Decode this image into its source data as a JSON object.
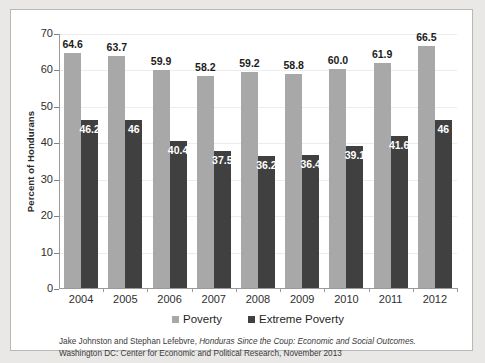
{
  "chart_data": {
    "type": "bar",
    "title": "",
    "xlabel": "",
    "ylabel": "Percent of Hondurans",
    "ylim": [
      0,
      70
    ],
    "yticks": [
      0,
      10,
      20,
      30,
      40,
      50,
      60,
      70
    ],
    "grid": true,
    "legend_position": "bottom",
    "categories": [
      "2004",
      "2005",
      "2006",
      "2007",
      "2008",
      "2009",
      "2010",
      "2011",
      "2012"
    ],
    "series": [
      {
        "name": "Poverty",
        "color": "#a8a8a8",
        "values": [
          64.6,
          63.7,
          59.9,
          58.2,
          59.2,
          58.8,
          60.0,
          61.9,
          66.5
        ],
        "labels": [
          "64.6",
          "63.7",
          "59.9",
          "58.2",
          "59.2",
          "58.8",
          "60.0",
          "61.9",
          "66.5"
        ]
      },
      {
        "name": "Extreme Poverty",
        "color": "#404040",
        "values": [
          46.2,
          46,
          40.4,
          37.5,
          36.2,
          36.4,
          39.1,
          41.6,
          46
        ],
        "labels": [
          "46.2",
          "46",
          "40.4",
          "37.5",
          "36.2",
          "36.4",
          "39.1",
          "41.6",
          "46"
        ]
      }
    ]
  },
  "legend": {
    "items": [
      {
        "label": "Poverty",
        "swatch": "poverty"
      },
      {
        "label": "Extreme Poverty",
        "swatch": "extreme"
      }
    ]
  },
  "caption": {
    "line1_pre": "Jake Johnston and Stephan Lefebvre, ",
    "line1_ital": "Honduras Since the Coup: Economic and Social Outcomes.",
    "line2": "Washington DC: Center for Economic and Political Research, November 2013"
  }
}
